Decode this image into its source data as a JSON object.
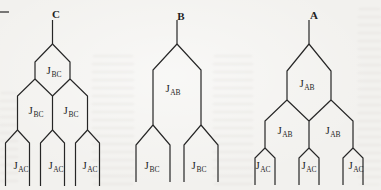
{
  "figure": {
    "colors": {
      "background": "#f2f1ee",
      "line": "#262626",
      "text": "#1f1f1f"
    },
    "trees": [
      {
        "id": "tree-c",
        "top_label": "C",
        "labels": [
          {
            "j": "J",
            "sub": "BC"
          },
          {
            "j": "J",
            "sub": "BC"
          },
          {
            "j": "J",
            "sub": "BC"
          },
          {
            "j": "J",
            "sub": "AC"
          },
          {
            "j": "J",
            "sub": "AC"
          },
          {
            "j": "J",
            "sub": "AC"
          }
        ]
      },
      {
        "id": "tree-b",
        "top_label": "B",
        "labels": [
          {
            "j": "J",
            "sub": "AB"
          },
          {
            "j": "J",
            "sub": "BC"
          },
          {
            "j": "J",
            "sub": "BC"
          }
        ]
      },
      {
        "id": "tree-a",
        "top_label": "A",
        "labels": [
          {
            "j": "J",
            "sub": "AB"
          },
          {
            "j": "J",
            "sub": "AB"
          },
          {
            "j": "J",
            "sub": "AB"
          },
          {
            "j": "J",
            "sub": "AC"
          },
          {
            "j": "J",
            "sub": "AC"
          },
          {
            "j": "J",
            "sub": "AC"
          }
        ]
      }
    ]
  }
}
